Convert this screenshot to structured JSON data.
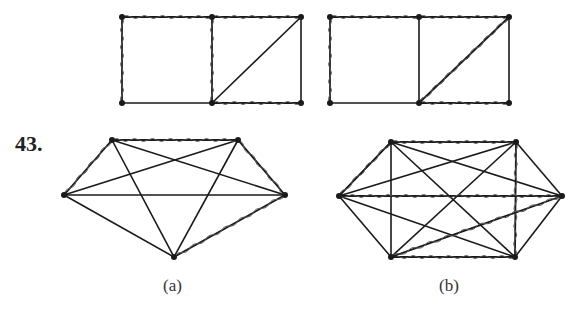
{
  "problem_number": "43.",
  "labels": {
    "a": "(a)",
    "b": "(b)"
  },
  "figures": {
    "top_left_grid": {
      "vertices": [
        [
          122,
          17
        ],
        [
          212,
          17
        ],
        [
          301,
          17
        ],
        [
          122,
          103
        ],
        [
          212,
          103
        ],
        [
          301,
          103
        ]
      ],
      "plain_edges": [
        [
          3,
          4
        ],
        [
          2,
          5
        ],
        [
          2,
          4
        ]
      ],
      "wavy_edges": [
        [
          0,
          1
        ],
        [
          1,
          2
        ],
        [
          0,
          3
        ],
        [
          1,
          4
        ],
        [
          4,
          5
        ]
      ]
    },
    "top_right_grid": {
      "vertices": [
        [
          330,
          17
        ],
        [
          419,
          17
        ],
        [
          509,
          17
        ],
        [
          330,
          103
        ],
        [
          419,
          103
        ],
        [
          509,
          103
        ]
      ],
      "plain_edges": [
        [
          3,
          4
        ],
        [
          1,
          4
        ],
        [
          2,
          5
        ]
      ],
      "wavy_edges": [
        [
          0,
          1
        ],
        [
          1,
          2
        ],
        [
          0,
          3
        ],
        [
          4,
          2
        ],
        [
          4,
          5
        ]
      ]
    },
    "graph_a": {
      "description": "Complete graph K5 with a highlighted Hamilton circuit",
      "vertices": [
        [
          112,
          140
        ],
        [
          238,
          140
        ],
        [
          285,
          195
        ],
        [
          174,
          257
        ],
        [
          64,
          195
        ]
      ],
      "wavy_edges": [
        [
          0,
          1
        ],
        [
          1,
          2
        ],
        [
          2,
          3
        ],
        [
          4,
          0
        ]
      ],
      "plain_edges": [
        [
          0,
          2
        ],
        [
          0,
          3
        ],
        [
          1,
          3
        ],
        [
          1,
          4
        ],
        [
          2,
          4
        ],
        [
          3,
          4
        ]
      ]
    },
    "graph_b": {
      "description": "Complete graph K6 with a highlighted Hamilton circuit",
      "vertices": [
        [
          391,
          142
        ],
        [
          516,
          142
        ],
        [
          562,
          196
        ],
        [
          515,
          257
        ],
        [
          391,
          257
        ],
        [
          339,
          196
        ]
      ],
      "wavy_edges": [
        [
          0,
          1
        ],
        [
          1,
          3
        ],
        [
          3,
          4
        ],
        [
          4,
          2
        ],
        [
          2,
          5
        ],
        [
          5,
          0
        ]
      ],
      "plain_edges": [
        [
          0,
          2
        ],
        [
          0,
          3
        ],
        [
          0,
          4
        ],
        [
          1,
          2
        ],
        [
          1,
          4
        ],
        [
          1,
          5
        ],
        [
          2,
          3
        ],
        [
          3,
          5
        ],
        [
          4,
          5
        ],
        [
          0,
          5
        ]
      ]
    }
  },
  "colors": {
    "line": "#1a1a1a",
    "wave": "#555555",
    "background": "#ffffff"
  }
}
